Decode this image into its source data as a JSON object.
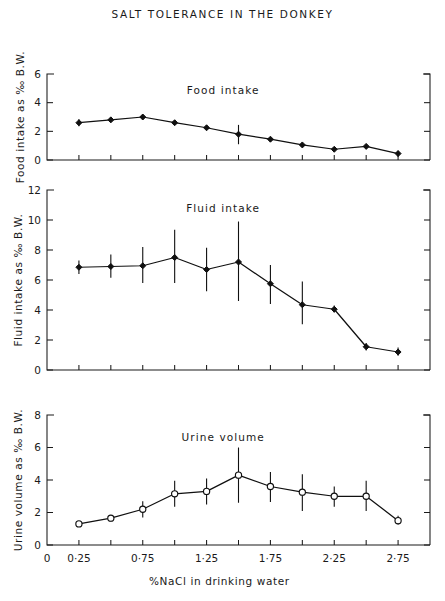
{
  "figure": {
    "title": "SALT  TOLERANCE  IN  THE  DONKEY",
    "xlabel": "‰ NaCl in drinking water",
    "xlabel_display": "%NaCl  in  drinking  water",
    "background_color": "#ffffff",
    "ink_color": "#101010"
  },
  "chart_data": [
    {
      "type": "line",
      "title": "Food  intake",
      "panel_index": 1,
      "xlabel": "",
      "ylabel": "Food intake as % B.W.",
      "xlim": [
        0,
        3.0
      ],
      "ylim": [
        0,
        6
      ],
      "yticks": [
        0,
        2,
        4,
        6
      ],
      "ytick_labels": [
        "0",
        "2",
        "4",
        "6"
      ],
      "xticks": [
        0.25,
        0.5,
        0.75,
        1.0,
        1.25,
        1.5,
        1.75,
        2.0,
        2.25,
        2.5,
        2.75
      ],
      "xtick_labels": [
        "0",
        "0·25",
        "0·75",
        "1·25",
        "1·75",
        "2·25",
        "2·75"
      ],
      "grid": false,
      "legend": "none",
      "marker": "filled-diamond",
      "x": [
        0.25,
        0.5,
        0.75,
        1.0,
        1.25,
        1.5,
        1.75,
        2.0,
        2.25,
        2.5,
        2.75
      ],
      "values": [
        2.6,
        2.8,
        3.0,
        2.6,
        2.25,
        1.8,
        1.45,
        1.05,
        0.75,
        0.95,
        0.45
      ],
      "errors_low": [
        2.35,
        2.65,
        2.85,
        2.45,
        2.1,
        1.1,
        1.3,
        0.9,
        0.6,
        0.8,
        0.25
      ],
      "errors_high": [
        2.85,
        2.95,
        3.15,
        2.75,
        2.4,
        2.45,
        1.6,
        1.2,
        0.9,
        1.1,
        0.65
      ]
    },
    {
      "type": "line",
      "title": "Fluid  intake",
      "panel_index": 2,
      "xlabel": "",
      "ylabel": "Fluid intake as % B.W.",
      "xlim": [
        0,
        3.0
      ],
      "ylim": [
        0,
        12
      ],
      "yticks": [
        0,
        2,
        4,
        6,
        8,
        10,
        12
      ],
      "ytick_labels": [
        "0",
        "2",
        "4",
        "6",
        "8",
        "10",
        "12"
      ],
      "xticks": [
        0.25,
        0.5,
        0.75,
        1.0,
        1.25,
        1.5,
        1.75,
        2.0,
        2.25,
        2.5,
        2.75
      ],
      "grid": false,
      "legend": "none",
      "marker": "filled-diamond",
      "x": [
        0.25,
        0.5,
        0.75,
        1.0,
        1.25,
        1.5,
        1.75,
        2.0,
        2.25,
        2.5,
        2.75
      ],
      "values": [
        6.85,
        6.9,
        6.95,
        7.5,
        6.7,
        7.2,
        5.75,
        4.35,
        4.05,
        1.55,
        1.2
      ],
      "errors_low": [
        6.4,
        6.15,
        5.8,
        5.8,
        5.25,
        4.6,
        4.4,
        3.05,
        3.85,
        1.3,
        0.95
      ],
      "errors_high": [
        7.3,
        7.7,
        8.2,
        9.35,
        8.15,
        9.9,
        7.0,
        5.9,
        4.3,
        1.8,
        1.5
      ]
    },
    {
      "type": "line",
      "title": "Urine  volume",
      "panel_index": 3,
      "xlabel": "‰ NaCl in drinking water",
      "ylabel": "Urine volume as % B.W.",
      "xlim": [
        0,
        3.0
      ],
      "ylim": [
        0,
        8
      ],
      "yticks": [
        0,
        2,
        4,
        6,
        8
      ],
      "ytick_labels": [
        "0",
        "2",
        "4",
        "6",
        "8"
      ],
      "xticks": [
        0.25,
        0.5,
        0.75,
        1.0,
        1.25,
        1.5,
        1.75,
        2.0,
        2.25,
        2.5,
        2.75
      ],
      "grid": false,
      "legend": "none",
      "marker": "open-circle",
      "x": [
        0.25,
        0.5,
        0.75,
        1.0,
        1.25,
        1.5,
        1.75,
        2.0,
        2.25,
        2.5,
        2.75
      ],
      "values": [
        1.3,
        1.65,
        2.2,
        3.15,
        3.3,
        4.3,
        3.6,
        3.25,
        3.0,
        3.0,
        1.5
      ],
      "errors_low": [
        1.15,
        1.45,
        1.7,
        2.35,
        2.5,
        2.6,
        2.65,
        2.1,
        2.35,
        2.1,
        1.25
      ],
      "errors_high": [
        1.45,
        1.85,
        2.7,
        3.95,
        4.1,
        6.0,
        4.5,
        4.35,
        3.6,
        3.95,
        1.8
      ]
    }
  ],
  "axis_labels": {
    "panel1_y": "Food  intake  as  ‰ B.W.",
    "panel2_y": "Fluid  intake  as  ‰ B.W.",
    "panel3_y": "Urine  volume  as  ‰ B.W.",
    "x_axis": "%NaCl  in  drinking  water",
    "x_tick_values": [
      "0",
      "0·25",
      "0·75",
      "1·25",
      "1·75",
      "2·25",
      "2·75"
    ]
  }
}
